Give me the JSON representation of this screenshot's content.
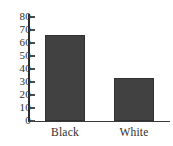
{
  "chart_data": {
    "type": "bar",
    "title": "",
    "subtitle": "",
    "xlabel": "",
    "ylabel": "",
    "categories": [
      "Black",
      "White"
    ],
    "values": [
      66,
      33
    ],
    "series": [
      {
        "name": "",
        "values": [
          66,
          33
        ]
      }
    ],
    "ylim": [
      0,
      80
    ],
    "yticks": [
      0,
      10,
      20,
      30,
      40,
      50,
      60,
      70,
      80
    ],
    "ytick_labels": [
      "0",
      "10",
      "20",
      "30",
      "40",
      "50",
      "60",
      "70",
      "80"
    ],
    "grid": false,
    "legend": false,
    "legend_position": "none",
    "annotations": [],
    "colors": {
      "bar_fill": "#414141",
      "bar_border": "#313131",
      "axis": "#2b2b2b",
      "tick": "#4a4a4a",
      "text": "#2e2e2e",
      "background": "#ffffff"
    }
  },
  "axis": {
    "y_ticks": [
      {
        "label": "80",
        "value": 80
      },
      {
        "label": "70",
        "value": 70
      },
      {
        "label": "60",
        "value": 60
      },
      {
        "label": "50",
        "value": 50
      },
      {
        "label": "40",
        "value": 40
      },
      {
        "label": "30",
        "value": 30
      },
      {
        "label": "20",
        "value": 20
      },
      {
        "label": "10",
        "value": 10
      },
      {
        "label": "0",
        "value": 0
      }
    ]
  },
  "bars": [
    {
      "label": "Black",
      "value": 66
    },
    {
      "label": "White",
      "value": 33
    }
  ]
}
